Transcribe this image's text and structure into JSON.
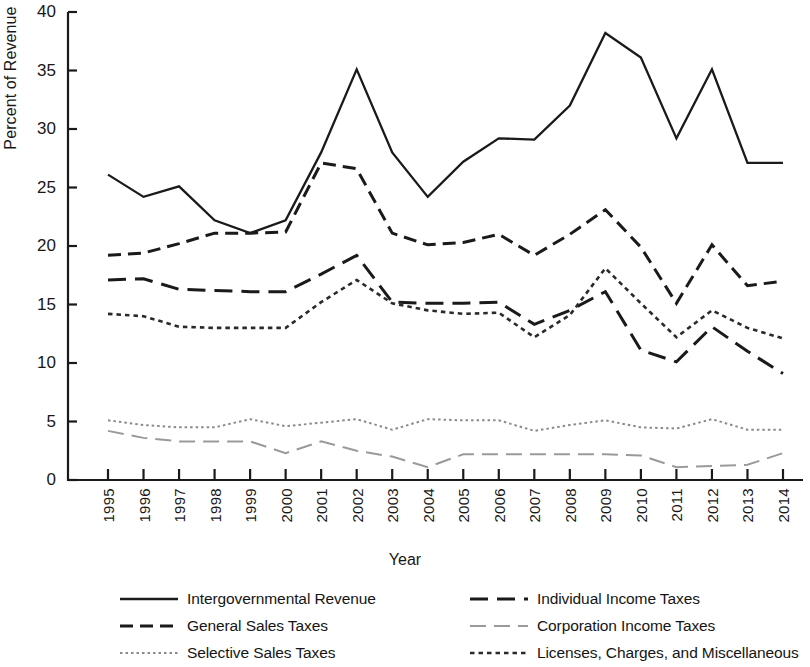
{
  "chart_data": {
    "type": "line",
    "title": "",
    "xlabel": "Year",
    "ylabel": "Percent of Revenue",
    "grid": false,
    "legend_position": "bottom",
    "xlim": [
      1995,
      2014
    ],
    "ylim": [
      0,
      40
    ],
    "yticks": [
      0,
      5,
      10,
      15,
      20,
      25,
      30,
      35,
      40
    ],
    "categories": [
      "1995",
      "1996",
      "1997",
      "1998",
      "1999",
      "2000",
      "2001",
      "2002",
      "2003",
      "2004",
      "2005",
      "2006",
      "2007",
      "2008",
      "2009",
      "2010",
      "2011",
      "2012",
      "2013",
      "2014"
    ],
    "series": [
      {
        "name": "Intergovernmental Revenue",
        "style": "solid",
        "color": "#1a1a1a",
        "values": [
          26.1,
          24.2,
          25.1,
          22.2,
          21.1,
          22.2,
          28.0,
          35.1,
          28.0,
          24.2,
          27.2,
          29.2,
          29.1,
          32.0,
          38.2,
          36.1,
          29.2,
          35.1,
          27.1,
          27.1
        ]
      },
      {
        "name": "General Sales Taxes",
        "style": "dashed",
        "color": "#1a1a1a",
        "values": [
          19.2,
          19.4,
          20.2,
          21.1,
          21.1,
          21.2,
          27.1,
          26.6,
          21.1,
          20.1,
          20.3,
          21.0,
          19.2,
          21.0,
          23.1,
          19.9,
          15.1,
          20.1,
          16.6,
          17.0
        ]
      },
      {
        "name": "Selective Sales Taxes",
        "style": "dotted-fine",
        "color": "#8a8a8a",
        "values": [
          5.1,
          4.7,
          4.5,
          4.5,
          5.2,
          4.6,
          4.9,
          5.2,
          4.3,
          5.2,
          5.1,
          5.1,
          4.2,
          4.7,
          5.1,
          4.5,
          4.4,
          5.2,
          4.3,
          4.3
        ]
      },
      {
        "name": "Individual Income Taxes",
        "style": "long-dash",
        "color": "#1a1a1a",
        "values": [
          17.1,
          17.2,
          16.3,
          16.2,
          16.1,
          16.1,
          17.6,
          19.2,
          15.2,
          15.1,
          15.1,
          15.2,
          13.3,
          14.5,
          16.1,
          11.1,
          10.1,
          13.1,
          11.0,
          9.1
        ]
      },
      {
        "name": "Corporation Income Taxes",
        "style": "loose-dash-light",
        "color": "#9a9a9a",
        "values": [
          4.2,
          3.6,
          3.3,
          3.3,
          3.3,
          2.3,
          3.3,
          2.5,
          2.0,
          1.1,
          2.2,
          2.2,
          2.2,
          2.2,
          2.2,
          2.1,
          1.1,
          1.2,
          1.3,
          2.3
        ]
      },
      {
        "name": "Licenses, Charges, and Miscellaneous",
        "style": "dotted",
        "color": "#2a2a2a",
        "values": [
          14.2,
          14.0,
          13.1,
          13.0,
          13.0,
          13.0,
          15.2,
          17.1,
          15.1,
          14.5,
          14.2,
          14.3,
          12.2,
          14.1,
          18.1,
          15.1,
          12.2,
          14.5,
          13.0,
          12.1
        ]
      }
    ]
  },
  "axes": {
    "ylabel": "Percent of Revenue",
    "xlabel": "Year"
  },
  "legend": {
    "items": [
      {
        "label": "Intergovernmental Revenue",
        "style": "solid"
      },
      {
        "label": "Individual Income Taxes",
        "style": "long-dash"
      },
      {
        "label": "General Sales Taxes",
        "style": "dashed"
      },
      {
        "label": "Corporation Income Taxes",
        "style": "loose-dash-light"
      },
      {
        "label": "Selective Sales Taxes",
        "style": "dotted-fine"
      },
      {
        "label": "Licenses, Charges, and Miscellaneous",
        "style": "dotted"
      }
    ]
  }
}
